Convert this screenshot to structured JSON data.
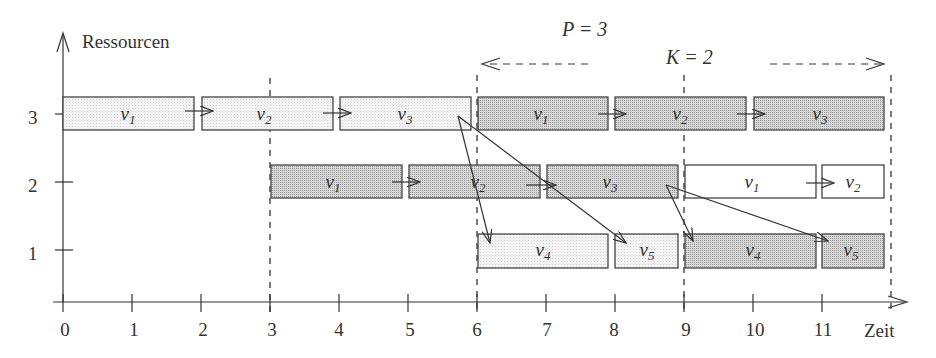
{
  "diagram": {
    "type": "gantt-schedule",
    "y_axis": {
      "label": "Ressourcen",
      "ticks": [
        1,
        2,
        3
      ]
    },
    "x_axis": {
      "label": "Zeit",
      "ticks": [
        0,
        1,
        2,
        3,
        4,
        5,
        6,
        7,
        8,
        9,
        10,
        11
      ]
    },
    "annotations": {
      "period": "P = 3",
      "latency": "K = 2"
    },
    "colors": {
      "iteration1": "#ececec",
      "iteration2": "#c8c8c8",
      "iteration3": "#ffffff",
      "stroke": "#444444"
    },
    "dashed_markers": [
      3,
      6,
      9,
      12
    ],
    "tasks": [
      {
        "label": "v",
        "sub": "1",
        "resource": 3,
        "start": 0,
        "end": 1.9,
        "iteration": 1
      },
      {
        "label": "v",
        "sub": "2",
        "resource": 3,
        "start": 2,
        "end": 3.9,
        "iteration": 1
      },
      {
        "label": "v",
        "sub": "3",
        "resource": 3,
        "start": 4,
        "end": 5.9,
        "iteration": 1
      },
      {
        "label": "v",
        "sub": "1",
        "resource": 3,
        "start": 6,
        "end": 7.9,
        "iteration": 2
      },
      {
        "label": "v",
        "sub": "2",
        "resource": 3,
        "start": 8,
        "end": 9.9,
        "iteration": 2
      },
      {
        "label": "v",
        "sub": "3",
        "resource": 3,
        "start": 10,
        "end": 11.9,
        "iteration": 2
      },
      {
        "label": "v",
        "sub": "1",
        "resource": 2,
        "start": 3,
        "end": 4.9,
        "iteration": 2
      },
      {
        "label": "v",
        "sub": "2",
        "resource": 2,
        "start": 5,
        "end": 6.9,
        "iteration": 2
      },
      {
        "label": "v",
        "sub": "3",
        "resource": 2,
        "start": 7,
        "end": 8.9,
        "iteration": 2
      },
      {
        "label": "v",
        "sub": "1",
        "resource": 2,
        "start": 9,
        "end": 10.9,
        "iteration": 3
      },
      {
        "label": "v",
        "sub": "2",
        "resource": 2,
        "start": 11,
        "end": 11.9,
        "iteration": 3
      },
      {
        "label": "v",
        "sub": "4",
        "resource": 1,
        "start": 6,
        "end": 7.9,
        "iteration": 1
      },
      {
        "label": "v",
        "sub": "5",
        "resource": 1,
        "start": 8,
        "end": 8.9,
        "iteration": 1
      },
      {
        "label": "v",
        "sub": "4",
        "resource": 1,
        "start": 9,
        "end": 10.9,
        "iteration": 2
      },
      {
        "label": "v",
        "sub": "5",
        "resource": 1,
        "start": 11,
        "end": 11.9,
        "iteration": 2
      }
    ]
  }
}
